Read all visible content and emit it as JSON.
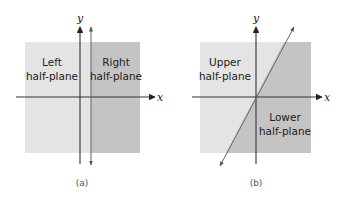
{
  "colors": {
    "light_region": "#e3e3e3",
    "dark_region": "#c2c2c2",
    "axis": "#333333",
    "divider_line": "#666666"
  },
  "panels": [
    {
      "caption": "(a)",
      "x_axis_label": "x",
      "y_axis_label": "y",
      "region_left_line1": "Left",
      "region_left_line2": "half-plane",
      "region_right_line1": "Right",
      "region_right_line2": "half-plane",
      "divider": "vertical line"
    },
    {
      "caption": "(b)",
      "x_axis_label": "x",
      "y_axis_label": "y",
      "region_upper_line1": "Upper",
      "region_upper_line2": "half-plane",
      "region_lower_line1": "Lower",
      "region_lower_line2": "half-plane",
      "divider": "diagonal line through origin"
    }
  ]
}
